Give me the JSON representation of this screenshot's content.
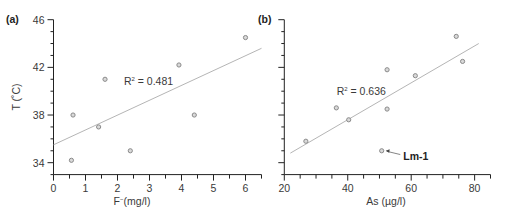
{
  "chart_data": [
    {
      "type": "scatter",
      "panel_label": "(a)",
      "title": "",
      "xlabel": "F⁻(mg/l)",
      "xlabel_main": "F",
      "xlabel_sup": "−",
      "xlabel_rest": "(mg/l)",
      "ylabel": "T (˚C)",
      "xlim": [
        0,
        6.5
      ],
      "ylim": [
        33,
        46
      ],
      "xticks": [
        0,
        1,
        2,
        3,
        4,
        5,
        6
      ],
      "xtick_labels": [
        "0",
        "1",
        "2",
        "3",
        "4",
        "5",
        "6"
      ],
      "x_minor_step": 0.5,
      "yticks": [
        34,
        38,
        42,
        46
      ],
      "ytick_labels": [
        "34",
        "38",
        "42",
        "46"
      ],
      "y_minor_step": 1,
      "grid": false,
      "points": [
        {
          "x": 0.56,
          "y": 34.2
        },
        {
          "x": 0.61,
          "y": 38.0
        },
        {
          "x": 1.41,
          "y": 37.0
        },
        {
          "x": 1.61,
          "y": 41.0
        },
        {
          "x": 2.4,
          "y": 35.0
        },
        {
          "x": 3.92,
          "y": 42.2
        },
        {
          "x": 4.4,
          "y": 38.0
        },
        {
          "x": 6.0,
          "y": 44.5
        }
      ],
      "trendline": {
        "x1": 0,
        "y1": 35.5,
        "x2": 6.5,
        "y2": 43.6
      },
      "annotation": {
        "text_main": "R",
        "text_sup": "2",
        "text_rest": " = 0.481",
        "x": 2.2,
        "y": 40.5
      },
      "marker_color": "#8a8a8a",
      "line_color": "#b5b5b5"
    },
    {
      "type": "scatter",
      "panel_label": "(b)",
      "title": "",
      "xlabel": "As (µg/l)",
      "ylabel": "",
      "xlim": [
        20,
        85
      ],
      "ylim": [
        33,
        46
      ],
      "xticks": [
        20,
        40,
        60,
        80
      ],
      "xtick_labels": [
        "20",
        "40",
        "60",
        "80"
      ],
      "x_minor_step": 5,
      "yticks": [
        34,
        38,
        42,
        46
      ],
      "ytick_labels": [],
      "y_minor_step": 1,
      "grid": false,
      "points": [
        {
          "x": 26.8,
          "y": 35.8
        },
        {
          "x": 36.4,
          "y": 38.6
        },
        {
          "x": 40.3,
          "y": 37.6
        },
        {
          "x": 50.7,
          "y": 35.0
        },
        {
          "x": 52.4,
          "y": 41.8
        },
        {
          "x": 52.4,
          "y": 38.5
        },
        {
          "x": 61.3,
          "y": 41.3
        },
        {
          "x": 74.2,
          "y": 44.6
        },
        {
          "x": 76.2,
          "y": 42.5
        }
      ],
      "trendline": {
        "x1": 21.9,
        "y1": 34.8,
        "x2": 81.3,
        "y2": 44.0
      },
      "annotation": {
        "text_main": "R",
        "text_sup": "2",
        "text_rest": " = 0.636",
        "x": 36.5,
        "y": 39.7
      },
      "callout": {
        "text": "Lm-1",
        "point": {
          "x": 50.7,
          "y": 35.0
        },
        "label_x": 57.5,
        "label_y": 34.6
      },
      "marker_color": "#8a8a8a",
      "line_color": "#b5b5b5"
    }
  ]
}
